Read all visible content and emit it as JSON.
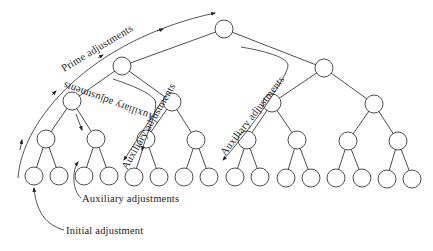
{
  "diagram": {
    "type": "binary-tree-adjustment-flow",
    "levels": 5,
    "node_count": 31,
    "labels": {
      "prime": "Prime adjustments",
      "aux_inner_left": "Auxiliary adjustments",
      "aux_inner_mid": "Auxiliary adjustments",
      "aux_inner_right": "Auxiliary adjustments",
      "aux_bottom": "Auxiliary adjustments",
      "initial": "Initial adjustment"
    },
    "colors": {
      "line": "#3a3a3a",
      "text": "#222222",
      "background": "#ffffff"
    }
  }
}
